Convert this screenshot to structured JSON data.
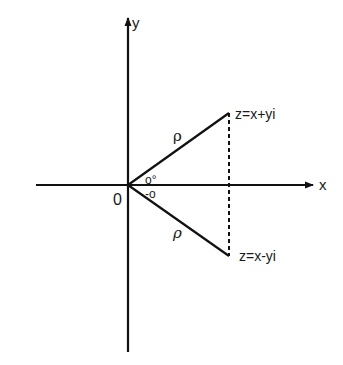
{
  "diagram": {
    "axes": {
      "x_label": "x",
      "y_label": "y",
      "origin_label": "0"
    },
    "points": [
      {
        "id": "z",
        "label": "z=x+yi"
      },
      {
        "id": "z_conj",
        "label": "z=x-yi"
      }
    ],
    "segments": {
      "upper_modulus_label": "ρ",
      "lower_modulus_label": "ρ"
    },
    "angles": {
      "upper_angle_label": "o°",
      "lower_angle_label": "-o"
    },
    "colors": {
      "stroke": "#111111",
      "background": "#ffffff"
    }
  }
}
